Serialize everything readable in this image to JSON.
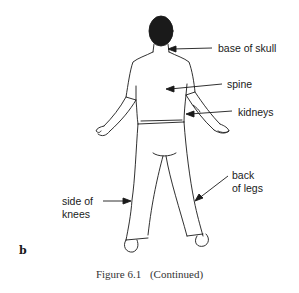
{
  "figure": {
    "panel_label": "b",
    "caption_number": "Figure 6.1",
    "caption_text": "(Continued)",
    "labels": [
      {
        "id": "base-of-skull",
        "text": "base of skull"
      },
      {
        "id": "spine",
        "text": "spine"
      },
      {
        "id": "kidneys",
        "text": "kidneys"
      },
      {
        "id": "back-of-legs-1",
        "text": "back"
      },
      {
        "id": "back-of-legs-2",
        "text": "of legs"
      },
      {
        "id": "side-of-knees-1",
        "text": "side of"
      },
      {
        "id": "side-of-knees-2",
        "text": "knees"
      }
    ]
  }
}
